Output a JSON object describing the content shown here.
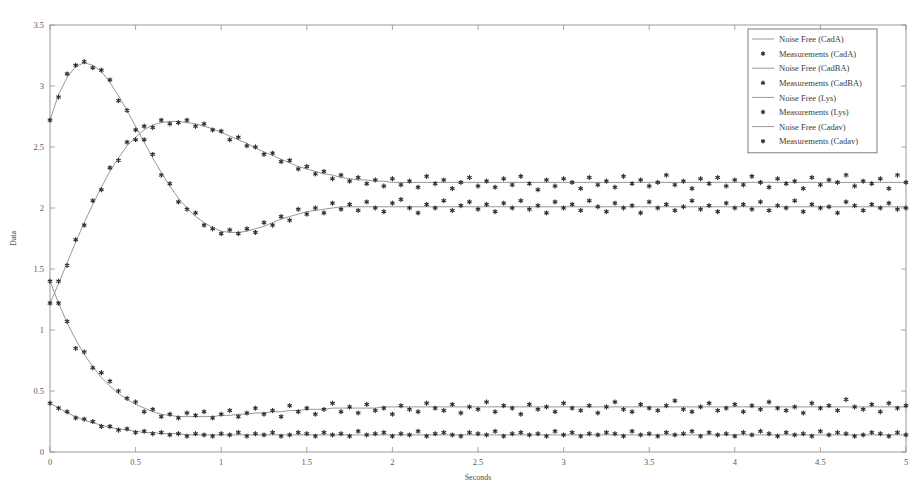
{
  "chart_data": {
    "type": "line",
    "title": "",
    "xlabel": "Seconds",
    "ylabel": "Data",
    "xlim": [
      0,
      5
    ],
    "ylim": [
      0,
      3.5
    ],
    "xticks": [
      "0",
      "0.5",
      "1",
      "1.5",
      "2",
      "2.5",
      "3",
      "3.5",
      "4",
      "4.5",
      "5"
    ],
    "yticks": [
      "0",
      "0.5",
      "1",
      "1.5",
      "2",
      "2.5",
      "3",
      "3.5"
    ],
    "xtick_values": [
      0,
      0.5,
      1,
      1.5,
      2,
      2.5,
      3,
      3.5,
      4,
      4.5,
      5
    ],
    "ytick_values": [
      0,
      0.5,
      1,
      1.5,
      2,
      2.5,
      3,
      3.5
    ],
    "grid": false,
    "legend_position": "top-right",
    "marker": "star",
    "line_color": "#8c8c8c",
    "marker_color": "#303030",
    "frame_color": "#8f8f8f",
    "background": "#ffffff",
    "legend": [
      {
        "label": "Noise Free (CadA)",
        "kind": "line"
      },
      {
        "label": "Measurements (CadA)",
        "kind": "marker"
      },
      {
        "label": "Noise Free (CadBA)",
        "kind": "line"
      },
      {
        "label": "Measurements (CadBA)",
        "kind": "marker"
      },
      {
        "label": "Noise Free (Lys)",
        "kind": "line"
      },
      {
        "label": "Measurements (Lys)",
        "kind": "marker"
      },
      {
        "label": "Noise Free (Cadav)",
        "kind": "line"
      },
      {
        "label": "Measurements (Cadav)",
        "kind": "marker"
      }
    ],
    "x": [
      0,
      0.05,
      0.1,
      0.15,
      0.2,
      0.25,
      0.3,
      0.35,
      0.4,
      0.45,
      0.5,
      0.55,
      0.6,
      0.65,
      0.7,
      0.75,
      0.8,
      0.85,
      0.9,
      0.95,
      1,
      1.05,
      1.1,
      1.15,
      1.2,
      1.25,
      1.3,
      1.35,
      1.4,
      1.45,
      1.5,
      1.55,
      1.6,
      1.65,
      1.7,
      1.75,
      1.8,
      1.85,
      1.9,
      1.95,
      2,
      2.05,
      2.1,
      2.15,
      2.2,
      2.25,
      2.3,
      2.35,
      2.4,
      2.45,
      2.5,
      2.55,
      2.6,
      2.65,
      2.7,
      2.75,
      2.8,
      2.85,
      2.9,
      2.95,
      3,
      3.05,
      3.1,
      3.15,
      3.2,
      3.25,
      3.3,
      3.35,
      3.4,
      3.45,
      3.5,
      3.55,
      3.6,
      3.65,
      3.7,
      3.75,
      3.8,
      3.85,
      3.9,
      3.95,
      4,
      4.05,
      4.1,
      4.15,
      4.2,
      4.25,
      4.3,
      4.35,
      4.4,
      4.45,
      4.5,
      4.55,
      4.6,
      4.65,
      4.7,
      4.75,
      4.8,
      4.85,
      4.9,
      4.95,
      5
    ],
    "series": [
      {
        "name": "CadA",
        "noise_free": [
          2.72,
          2.93,
          3.07,
          3.16,
          3.19,
          3.17,
          3.12,
          3.03,
          2.92,
          2.8,
          2.67,
          2.54,
          2.41,
          2.29,
          2.18,
          2.08,
          2.0,
          1.93,
          1.88,
          1.84,
          1.81,
          1.8,
          1.8,
          1.81,
          1.83,
          1.85,
          1.88,
          1.91,
          1.93,
          1.95,
          1.97,
          1.98,
          1.99,
          2.0,
          2.01,
          2.01,
          2.01,
          2.01,
          2.01,
          2.01,
          2.01,
          2.01,
          2.01,
          2.01,
          2.01,
          2.01,
          2.01,
          2.01,
          2.01,
          2.01,
          2.01,
          2.01,
          2.01,
          2.01,
          2.01,
          2.01,
          2.01,
          2.01,
          2.01,
          2.01,
          2.01,
          2.01,
          2.01,
          2.01,
          2.01,
          2.01,
          2.01,
          2.01,
          2.01,
          2.01,
          2.01,
          2.01,
          2.01,
          2.01,
          2.01,
          2.01,
          2.01,
          2.01,
          2.01,
          2.01,
          2.01,
          2.01,
          2.01,
          2.01,
          2.01,
          2.01,
          2.01,
          2.01,
          2.01,
          2.01,
          2.01,
          2.01,
          2.01,
          2.01,
          2.01,
          2.01,
          2.01,
          2.01,
          2.01,
          2.01,
          2.01
        ],
        "measurements": [
          2.72,
          2.91,
          3.1,
          3.17,
          3.2,
          3.15,
          3.13,
          3.05,
          2.88,
          2.8,
          2.64,
          2.56,
          2.44,
          2.27,
          2.2,
          2.05,
          1.99,
          1.96,
          1.86,
          1.83,
          1.79,
          1.82,
          1.79,
          1.83,
          1.8,
          1.88,
          1.86,
          1.93,
          1.9,
          1.99,
          1.95,
          2.0,
          1.96,
          2.04,
          1.99,
          2.03,
          1.98,
          2.05,
          2.0,
          1.97,
          2.04,
          2.07,
          2.0,
          1.96,
          2.03,
          2.0,
          2.06,
          1.98,
          2.02,
          2.05,
          1.99,
          2.03,
          1.97,
          2.04,
          2.0,
          2.06,
          1.99,
          2.02,
          1.96,
          2.05,
          2.0,
          2.03,
          1.98,
          2.06,
          2.01,
          1.97,
          2.04,
          2.0,
          2.02,
          1.96,
          2.05,
          2.0,
          2.03,
          1.98,
          2.01,
          2.06,
          1.99,
          2.02,
          1.97,
          2.04,
          2.0,
          2.03,
          1.99,
          2.05,
          1.98,
          2.02,
          2.0,
          2.06,
          1.97,
          2.03,
          2.0,
          2.01,
          1.96,
          2.05,
          2.02,
          1.98,
          2.03,
          2.0,
          2.04,
          1.99,
          2.0
        ]
      },
      {
        "name": "CadBA",
        "noise_free": [
          1.22,
          1.38,
          1.55,
          1.72,
          1.88,
          2.03,
          2.17,
          2.3,
          2.41,
          2.51,
          2.58,
          2.64,
          2.68,
          2.7,
          2.71,
          2.71,
          2.7,
          2.69,
          2.67,
          2.65,
          2.62,
          2.59,
          2.56,
          2.53,
          2.49,
          2.46,
          2.43,
          2.4,
          2.37,
          2.34,
          2.32,
          2.3,
          2.28,
          2.27,
          2.25,
          2.24,
          2.23,
          2.23,
          2.22,
          2.22,
          2.21,
          2.21,
          2.21,
          2.21,
          2.21,
          2.21,
          2.21,
          2.21,
          2.21,
          2.21,
          2.21,
          2.21,
          2.21,
          2.21,
          2.21,
          2.21,
          2.21,
          2.21,
          2.21,
          2.21,
          2.21,
          2.21,
          2.21,
          2.21,
          2.21,
          2.21,
          2.21,
          2.21,
          2.21,
          2.21,
          2.21,
          2.21,
          2.21,
          2.21,
          2.21,
          2.21,
          2.21,
          2.21,
          2.21,
          2.21,
          2.21,
          2.21,
          2.21,
          2.21,
          2.21,
          2.21,
          2.21,
          2.21,
          2.21,
          2.21,
          2.21,
          2.21,
          2.21,
          2.21,
          2.21,
          2.21,
          2.21,
          2.21,
          2.21,
          2.21,
          2.21
        ],
        "measurements": [
          1.22,
          1.4,
          1.53,
          1.74,
          1.86,
          2.06,
          2.15,
          2.33,
          2.39,
          2.54,
          2.56,
          2.67,
          2.66,
          2.72,
          2.69,
          2.7,
          2.72,
          2.67,
          2.69,
          2.64,
          2.63,
          2.56,
          2.58,
          2.51,
          2.5,
          2.44,
          2.45,
          2.38,
          2.39,
          2.32,
          2.34,
          2.28,
          2.3,
          2.24,
          2.27,
          2.22,
          2.25,
          2.2,
          2.23,
          2.18,
          2.24,
          2.19,
          2.22,
          2.17,
          2.26,
          2.2,
          2.23,
          2.16,
          2.21,
          2.25,
          2.18,
          2.22,
          2.17,
          2.24,
          2.19,
          2.26,
          2.2,
          2.15,
          2.23,
          2.18,
          2.24,
          2.21,
          2.16,
          2.25,
          2.19,
          2.22,
          2.17,
          2.26,
          2.2,
          2.23,
          2.18,
          2.21,
          2.27,
          2.19,
          2.22,
          2.16,
          2.24,
          2.2,
          2.25,
          2.18,
          2.23,
          2.19,
          2.26,
          2.21,
          2.17,
          2.24,
          2.2,
          2.22,
          2.16,
          2.25,
          2.19,
          2.23,
          2.21,
          2.27,
          2.18,
          2.22,
          2.2,
          2.24,
          2.16,
          2.27,
          2.21
        ]
      },
      {
        "name": "Lys",
        "noise_free": [
          1.4,
          1.22,
          1.06,
          0.92,
          0.8,
          0.7,
          0.61,
          0.54,
          0.48,
          0.43,
          0.39,
          0.36,
          0.33,
          0.31,
          0.3,
          0.29,
          0.29,
          0.29,
          0.29,
          0.29,
          0.3,
          0.3,
          0.31,
          0.31,
          0.32,
          0.32,
          0.33,
          0.33,
          0.34,
          0.34,
          0.35,
          0.35,
          0.35,
          0.36,
          0.36,
          0.36,
          0.36,
          0.36,
          0.36,
          0.37,
          0.37,
          0.37,
          0.37,
          0.37,
          0.37,
          0.37,
          0.37,
          0.37,
          0.37,
          0.37,
          0.37,
          0.37,
          0.37,
          0.37,
          0.37,
          0.37,
          0.37,
          0.37,
          0.37,
          0.37,
          0.37,
          0.37,
          0.37,
          0.37,
          0.37,
          0.37,
          0.37,
          0.37,
          0.37,
          0.37,
          0.37,
          0.37,
          0.37,
          0.37,
          0.37,
          0.37,
          0.37,
          0.37,
          0.37,
          0.37,
          0.37,
          0.37,
          0.37,
          0.37,
          0.37,
          0.37,
          0.37,
          0.37,
          0.37,
          0.37,
          0.37,
          0.37,
          0.37,
          0.37,
          0.37,
          0.37,
          0.37,
          0.37,
          0.37,
          0.37,
          0.37
        ],
        "measurements": [
          1.4,
          1.22,
          1.07,
          0.85,
          0.82,
          0.69,
          0.65,
          0.58,
          0.5,
          0.44,
          0.41,
          0.33,
          0.35,
          0.29,
          0.31,
          0.28,
          0.32,
          0.3,
          0.33,
          0.28,
          0.31,
          0.34,
          0.29,
          0.32,
          0.36,
          0.31,
          0.34,
          0.29,
          0.38,
          0.33,
          0.36,
          0.31,
          0.35,
          0.4,
          0.33,
          0.37,
          0.32,
          0.39,
          0.34,
          0.36,
          0.31,
          0.38,
          0.35,
          0.33,
          0.4,
          0.36,
          0.34,
          0.39,
          0.32,
          0.37,
          0.35,
          0.41,
          0.33,
          0.38,
          0.36,
          0.31,
          0.39,
          0.35,
          0.37,
          0.33,
          0.4,
          0.36,
          0.34,
          0.38,
          0.32,
          0.37,
          0.41,
          0.35,
          0.33,
          0.39,
          0.36,
          0.34,
          0.38,
          0.42,
          0.35,
          0.33,
          0.37,
          0.4,
          0.34,
          0.36,
          0.39,
          0.33,
          0.38,
          0.35,
          0.41,
          0.36,
          0.34,
          0.37,
          0.32,
          0.4,
          0.36,
          0.38,
          0.34,
          0.43,
          0.37,
          0.35,
          0.39,
          0.33,
          0.4,
          0.36,
          0.38
        ]
      },
      {
        "name": "Cadav",
        "noise_free": [
          0.4,
          0.36,
          0.32,
          0.29,
          0.26,
          0.24,
          0.22,
          0.2,
          0.19,
          0.18,
          0.17,
          0.16,
          0.16,
          0.15,
          0.15,
          0.15,
          0.14,
          0.14,
          0.14,
          0.14,
          0.14,
          0.14,
          0.14,
          0.14,
          0.14,
          0.14,
          0.14,
          0.14,
          0.14,
          0.14,
          0.14,
          0.14,
          0.14,
          0.14,
          0.14,
          0.14,
          0.14,
          0.14,
          0.14,
          0.14,
          0.14,
          0.14,
          0.14,
          0.14,
          0.14,
          0.14,
          0.14,
          0.14,
          0.14,
          0.14,
          0.14,
          0.14,
          0.14,
          0.14,
          0.14,
          0.14,
          0.14,
          0.14,
          0.14,
          0.14,
          0.14,
          0.14,
          0.14,
          0.14,
          0.14,
          0.14,
          0.14,
          0.14,
          0.14,
          0.14,
          0.14,
          0.14,
          0.14,
          0.14,
          0.14,
          0.14,
          0.14,
          0.14,
          0.14,
          0.14,
          0.14,
          0.14,
          0.14,
          0.14,
          0.14,
          0.14,
          0.14,
          0.14,
          0.14,
          0.14,
          0.14,
          0.14,
          0.14,
          0.14,
          0.14,
          0.14,
          0.14,
          0.14,
          0.14,
          0.14,
          0.14
        ],
        "measurements": [
          0.4,
          0.36,
          0.33,
          0.28,
          0.27,
          0.25,
          0.21,
          0.21,
          0.18,
          0.19,
          0.16,
          0.17,
          0.15,
          0.16,
          0.14,
          0.15,
          0.13,
          0.15,
          0.14,
          0.13,
          0.15,
          0.14,
          0.16,
          0.13,
          0.15,
          0.14,
          0.16,
          0.13,
          0.14,
          0.16,
          0.15,
          0.13,
          0.16,
          0.14,
          0.15,
          0.13,
          0.17,
          0.14,
          0.15,
          0.16,
          0.13,
          0.15,
          0.14,
          0.17,
          0.13,
          0.15,
          0.16,
          0.14,
          0.13,
          0.16,
          0.15,
          0.14,
          0.17,
          0.13,
          0.15,
          0.16,
          0.14,
          0.15,
          0.13,
          0.17,
          0.14,
          0.16,
          0.13,
          0.15,
          0.14,
          0.16,
          0.15,
          0.13,
          0.17,
          0.14,
          0.15,
          0.13,
          0.16,
          0.14,
          0.15,
          0.17,
          0.13,
          0.16,
          0.14,
          0.15,
          0.13,
          0.16,
          0.14,
          0.17,
          0.15,
          0.13,
          0.16,
          0.14,
          0.15,
          0.13,
          0.17,
          0.14,
          0.16,
          0.15,
          0.13,
          0.14,
          0.16,
          0.15,
          0.13,
          0.16,
          0.14
        ]
      }
    ]
  }
}
